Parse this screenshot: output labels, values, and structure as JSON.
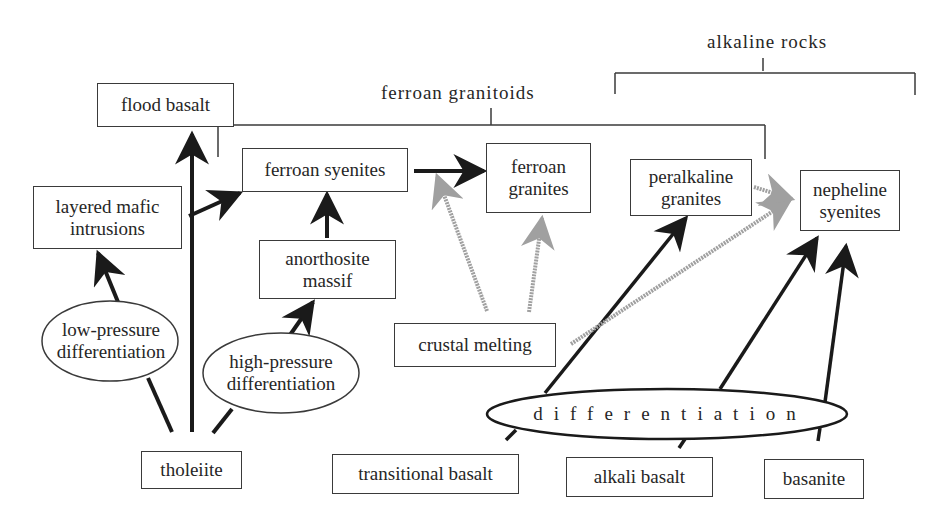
{
  "colors": {
    "line": "#1a1a1a",
    "box_border": "#3a3a3a",
    "gray_arrow": "#9a9a9a",
    "text": "#262626",
    "background": "#ffffff"
  },
  "groups": {
    "ferroan_granitoids": "ferroan granitoids",
    "alkaline_rocks": "alkaline rocks"
  },
  "boxes": {
    "flood_basalt": "flood basalt",
    "layered_mafic_1": "layered mafic",
    "layered_mafic_2": "intrusions",
    "ferroan_syenites": "ferroan syenites",
    "anorthosite_1": "anorthosite",
    "anorthosite_2": "massif",
    "ferroan_granites_1": "ferroan",
    "ferroan_granites_2": "granites",
    "peralkaline_1": "peralkaline",
    "peralkaline_2": "granites",
    "nepheline_1": "nepheline",
    "nepheline_2": "syenites",
    "crustal_melting": "crustal melting",
    "tholeiite": "tholeiite",
    "transitional_basalt": "transitional basalt",
    "alkali_basalt": "alkali basalt",
    "basanite": "basanite"
  },
  "processes": {
    "low_pressure_1": "low-pressure",
    "low_pressure_2": "differentiation",
    "high_pressure_1": "high-pressure",
    "high_pressure_2": "differentiation",
    "differentiation": "differentiation"
  },
  "edges": [
    {
      "from": "tholeiite",
      "to": "flood basalt",
      "style": "solid"
    },
    {
      "from": "tholeiite",
      "via": "low-pressure differentiation",
      "to": "layered mafic intrusions",
      "style": "solid"
    },
    {
      "from": "tholeiite",
      "via": "high-pressure differentiation",
      "to": "anorthosite massif",
      "style": "solid"
    },
    {
      "from": "tholeiite trunk",
      "to": "ferroan syenites",
      "style": "solid"
    },
    {
      "from": "anorthosite massif",
      "to": "ferroan syenites",
      "style": "solid"
    },
    {
      "from": "ferroan syenites",
      "to": "ferroan granites",
      "style": "solid"
    },
    {
      "from": "crustal melting",
      "to": "ferroan syenites-ferroan granites arrow",
      "style": "gray"
    },
    {
      "from": "crustal melting",
      "to": "ferroan granites",
      "style": "gray"
    },
    {
      "from": "crustal melting",
      "to": "nepheline syenites",
      "style": "gray"
    },
    {
      "from": "peralkaline granites",
      "to": "nepheline syenites",
      "style": "gray"
    },
    {
      "from": "transitional basalt",
      "via": "differentiation",
      "to": "peralkaline granites",
      "style": "solid"
    },
    {
      "from": "alkali basalt",
      "via": "differentiation",
      "to": "nepheline syenites",
      "style": "solid"
    },
    {
      "from": "basanite",
      "via": "differentiation",
      "to": "nepheline syenites",
      "style": "solid"
    }
  ]
}
